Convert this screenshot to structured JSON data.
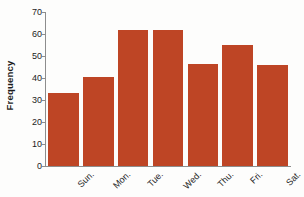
{
  "chart_data": {
    "type": "bar",
    "title": "",
    "subtitle": "",
    "xlabel": "",
    "ylabel": "Frequency",
    "categories": [
      "Sun.",
      "Mon.",
      "Tue.",
      "Wed.",
      "Thu.",
      "Fri.",
      "Sat."
    ],
    "values": [
      33,
      40.5,
      62,
      62,
      46.5,
      55,
      46
    ],
    "ylim": [
      0,
      70
    ],
    "yticks": [
      0,
      10,
      20,
      30,
      40,
      50,
      60,
      70
    ],
    "ytick_labels": [
      "0",
      "10",
      "20",
      "30",
      "40",
      "50",
      "60",
      "70"
    ],
    "grid": false,
    "legend": null,
    "bar_color": "#be4525",
    "axis_color": "#8d8d8d",
    "text_color": "#1c1c1c"
  }
}
